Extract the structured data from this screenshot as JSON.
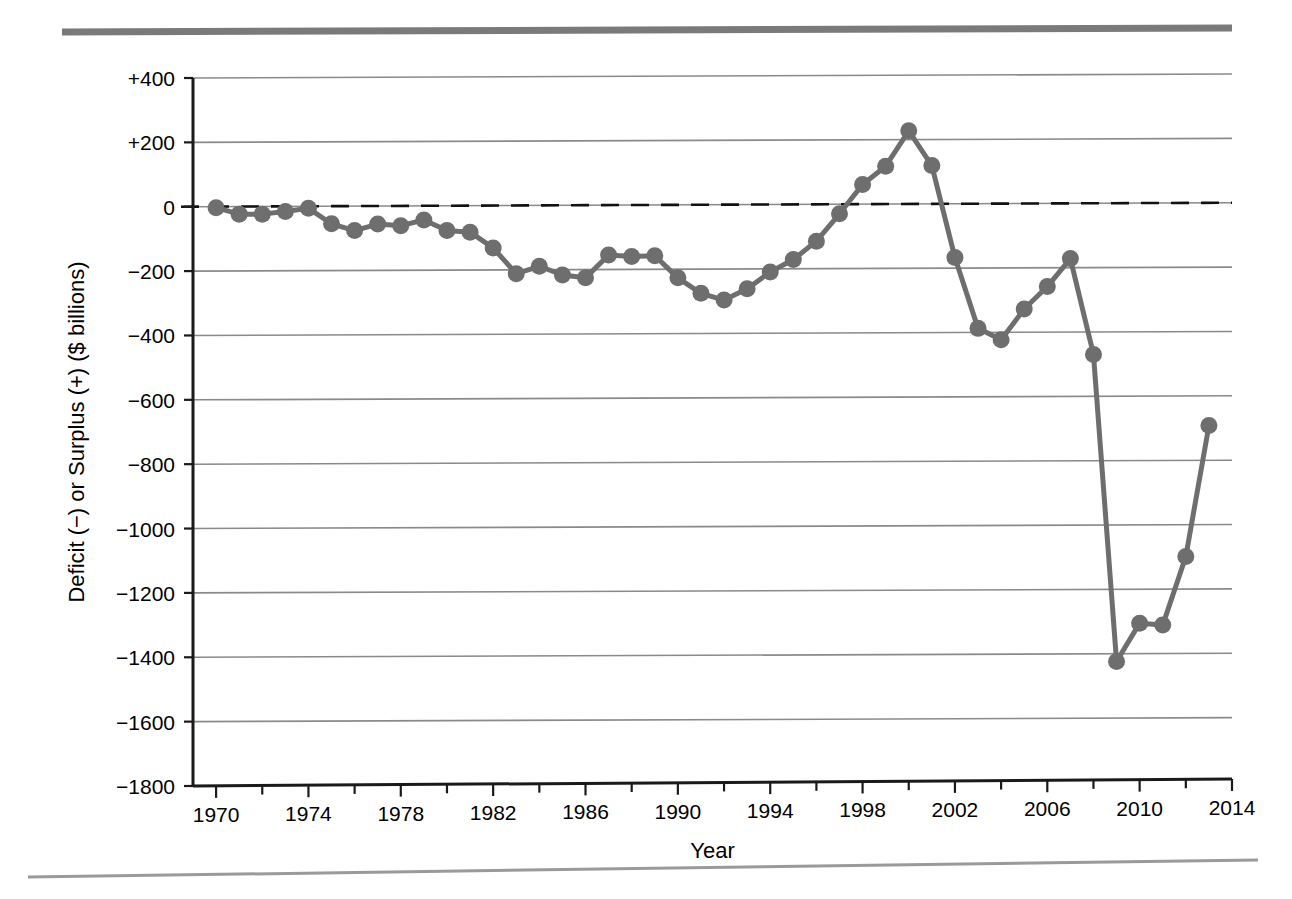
{
  "chart_data": {
    "type": "line",
    "title": "",
    "subtitle": "",
    "xlabel": "Year",
    "ylabel": "Deficit (−) or Surplus (+) ($ billions)",
    "xlim": [
      1969,
      2014
    ],
    "ylim": [
      -1800,
      400
    ],
    "ytick_step": 200,
    "xtick_step": 4,
    "xminortick_step": 2,
    "grid": "horizontal",
    "legend": "none",
    "zero_reference_line": {
      "value": 0,
      "style": "dashed"
    },
    "marker": "circle",
    "series_color": "#6e6e6e",
    "x": [
      1970,
      1971,
      1972,
      1973,
      1974,
      1975,
      1976,
      1977,
      1978,
      1979,
      1980,
      1981,
      1982,
      1983,
      1984,
      1985,
      1986,
      1987,
      1988,
      1989,
      1990,
      1991,
      1992,
      1993,
      1994,
      1995,
      1996,
      1997,
      1998,
      1999,
      2000,
      2001,
      2002,
      2003,
      2004,
      2005,
      2006,
      2007,
      2008,
      2009,
      2010,
      2011,
      2012,
      2013
    ],
    "values": [
      -3,
      -23,
      -23,
      -15,
      -5,
      -53,
      -74,
      -54,
      -59,
      -41,
      -74,
      -79,
      -128,
      -208,
      -185,
      -212,
      -221,
      -150,
      -155,
      -152,
      -221,
      -269,
      -290,
      -255,
      -203,
      -164,
      -107,
      -22,
      69,
      126,
      236,
      128,
      -158,
      -378,
      -413,
      -318,
      -248,
      -161,
      -459,
      -1413,
      -1294,
      -1300,
      -1087,
      -680
    ],
    "xtick_labels": [
      "1970",
      "1974",
      "1978",
      "1982",
      "1986",
      "1990",
      "1994",
      "1998",
      "2002",
      "2006",
      "2010",
      "2014"
    ],
    "ytick_labels": [
      "+400",
      "+200",
      "0",
      "−200",
      "−400",
      "−600",
      "−800",
      "−1000",
      "−1200",
      "−1400",
      "−1600",
      "−1800"
    ],
    "ytick_values": [
      400,
      200,
      0,
      -200,
      -400,
      -600,
      -800,
      -1000,
      -1200,
      -1400,
      -1600,
      -1800
    ]
  },
  "decorations": {
    "top_rule_label": "top-rule",
    "bottom_rule_label": "bottom-rule"
  },
  "colors": {
    "series": "#6e6e6e",
    "grid": "#8a8a8a",
    "axis": "#1a1a1a",
    "rule": "#777777",
    "background": "#ffffff"
  }
}
